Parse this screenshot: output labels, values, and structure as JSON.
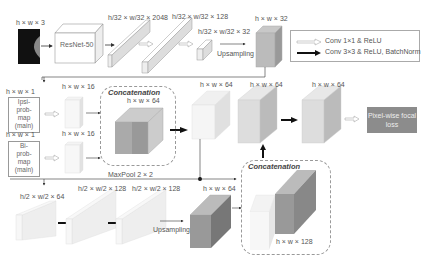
{
  "input": {
    "image_label": "h × w × 3",
    "backbone_label": "ResNet-50"
  },
  "top_branch": {
    "feat1_label": "h/32 × w/32 × 2048",
    "feat2_label": "h/32 × w/32 × 128",
    "feat3_label": "h/32 × w/32 × 32",
    "upsampling_label": "Upsampling",
    "upsampled_label": "h × w × 32"
  },
  "legend": {
    "conv1x1": "Conv 1×1 & ReLU",
    "conv3x3": "Conv 3×3 & ReLU, BatchNorm"
  },
  "side_inputs": [
    {
      "dim_label": "h × w × 1",
      "name_lines": [
        "Ipsi-",
        "prob-",
        "map",
        "(main)"
      ],
      "feat_label": "h × w × 16"
    },
    {
      "dim_label": "h × w × 1",
      "name_lines": [
        "Bi-",
        "prob-",
        "map",
        "(main)"
      ],
      "feat_label": "h × w × 16"
    }
  ],
  "concat1": {
    "title": "Concatenation",
    "dim_label": "h × w × 64"
  },
  "mid": {
    "block1_label": "h × w × 64",
    "block2_label": "h × w × 64",
    "block3_label": "h × w × 64"
  },
  "output": {
    "loss_label": "Pixel-wise focal loss"
  },
  "bottom_branch": {
    "maxpool_label": "MaxPool 2 × 2",
    "b1_label": "h/2 × w/2 × 64",
    "b2_label": "h/2 × w/2 × 128",
    "b3_label": "h/2 × w/2 × 128",
    "upsampling_label": "Upsampling",
    "up_label": "h × w × 64"
  },
  "concat2": {
    "title": "Concatenation",
    "dim_label": "h × w × 128"
  }
}
